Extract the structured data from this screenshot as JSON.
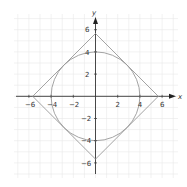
{
  "chart_data": {
    "type": "diagram",
    "title": "",
    "xlabel": "x",
    "ylabel": "y",
    "xlim": [
      -7,
      7
    ],
    "ylim": [
      -7,
      7
    ],
    "grid": true,
    "x_ticks": [
      -6,
      -4,
      -2,
      2,
      4,
      6
    ],
    "y_ticks": [
      6,
      4,
      2,
      -2,
      -4,
      -6
    ],
    "shapes": [
      {
        "name": "circle",
        "center": [
          0,
          0
        ],
        "radius": 4
      },
      {
        "name": "square",
        "vertices": [
          [
            5.66,
            0
          ],
          [
            0,
            5.66
          ],
          [
            -5.66,
            0
          ],
          [
            0,
            -5.66
          ]
        ],
        "note": "tangent to circle"
      }
    ]
  },
  "labels": {
    "x_axis": "x",
    "y_axis": "y",
    "x_ticks": [
      "−6",
      "−4",
      "−2",
      "2",
      "4",
      "6"
    ],
    "y_ticks": [
      "6",
      "4",
      "2",
      "−2",
      "−4",
      "−6"
    ]
  },
  "colors": {
    "grid": "#e6e6e6",
    "axis": "#333333",
    "shape": "#999999"
  }
}
